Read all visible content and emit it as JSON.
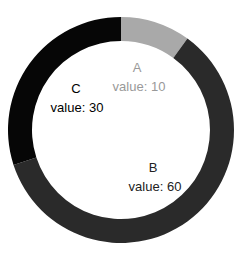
{
  "chart_data": {
    "type": "pie",
    "variant": "donut",
    "title": "",
    "categories": [
      "A",
      "B",
      "C"
    ],
    "values": [
      10,
      60,
      30
    ],
    "colors": [
      "#a9a9a9",
      "#2a2a2a",
      "#060606"
    ],
    "label_colors": [
      "#999999",
      "#222222",
      "#000000"
    ],
    "value_label_prefix": "value: ",
    "start_angle_deg": 0,
    "direction": "clockwise",
    "legend": "none"
  },
  "labels": {
    "A": {
      "name": "A",
      "value": "value: 10"
    },
    "B": {
      "name": "B",
      "value": "value: 60"
    },
    "C": {
      "name": "C",
      "value": "value: 30"
    }
  }
}
